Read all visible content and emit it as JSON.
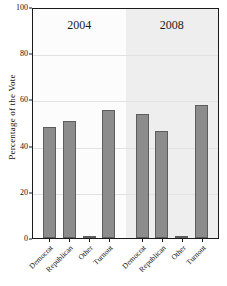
{
  "chart_data": {
    "type": "bar",
    "title": "",
    "subtitle": "",
    "xlabel": "",
    "ylabel": "Percentage of the Vote",
    "ylim": [
      0,
      100
    ],
    "yticks": [
      0,
      20,
      40,
      60,
      80,
      100
    ],
    "ytick_labels": [
      "0",
      "20",
      "40",
      "60",
      "80",
      "100"
    ],
    "grid": true,
    "legend": "none",
    "legend_position": "none",
    "panels": [
      {
        "label": "2004",
        "categories": [
          "Democrat",
          "Republican",
          "Other",
          "Turnout"
        ],
        "values": [
          48,
          50.5,
          1,
          55.5
        ]
      },
      {
        "label": "2008",
        "categories": [
          "Democrat",
          "Republican",
          "Other",
          "Turnout"
        ],
        "values": [
          53.5,
          46.5,
          1,
          57.5
        ]
      }
    ],
    "categories": [
      "Democrat",
      "Republican",
      "Other",
      "Turnout"
    ],
    "series": [
      {
        "name": "2004",
        "values": [
          48,
          50.5,
          1,
          55.5
        ]
      },
      {
        "name": "2008",
        "values": [
          53.5,
          46.5,
          1,
          57.5
        ]
      }
    ],
    "colors": {
      "bar_fill": "#8c8c8c",
      "bar_border": "#5d5d5d",
      "panel_2004_bg": "#fcfcfc",
      "panel_2008_bg": "#eeeeee",
      "gridline": "#e2e2e2",
      "frame": "#1a1a1a",
      "text": "#111111"
    }
  }
}
